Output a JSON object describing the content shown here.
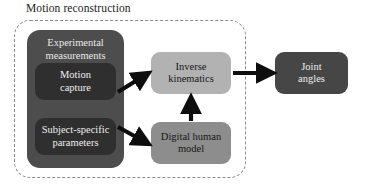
{
  "diagram": {
    "type": "flow-diagram",
    "title": "Motion reconstruction",
    "background_color": "#ffffff",
    "group": {
      "label": "Motion reconstruction",
      "border_style": "dashed",
      "border_color": "#8a8a8a"
    },
    "nodes": [
      {
        "id": "experimental-measurements",
        "label": "Experimental\nmeasurements",
        "fill": "#4d4d4d",
        "text_color": "#e9e9e9",
        "role": "container"
      },
      {
        "id": "motion-capture",
        "label": "Motion\ncapture",
        "fill": "#2f2f2f",
        "text_color": "#eeeeee",
        "role": "input"
      },
      {
        "id": "subject-specific-parameters",
        "label": "Subject-specific\nparameters",
        "fill": "#2f2f2f",
        "text_color": "#eeeeee",
        "role": "input"
      },
      {
        "id": "inverse-kinematics",
        "label": "Inverse\nkinematics",
        "fill": "#b2b2b2",
        "text_color": "#171717",
        "role": "process"
      },
      {
        "id": "digital-human-model",
        "label": "Digital human\nmodel",
        "fill": "#8d8d8d",
        "text_color": "#171717",
        "role": "model"
      },
      {
        "id": "joint-angles",
        "label": "Joint\nangles",
        "fill": "#464646",
        "text_color": "#ededed",
        "role": "output"
      }
    ],
    "edges": [
      {
        "id": "motion-capture-to-inverse-kinematics",
        "from": "motion-capture",
        "to": "inverse-kinematics",
        "direction": "diagonal-up-right"
      },
      {
        "id": "subject-params-to-digital-human-model",
        "from": "subject-specific-parameters",
        "to": "digital-human-model",
        "direction": "diagonal-down-right"
      },
      {
        "id": "digital-human-model-to-inverse-kinematics",
        "from": "digital-human-model",
        "to": "inverse-kinematics",
        "direction": "up"
      },
      {
        "id": "inverse-kinematics-to-joint-angles",
        "from": "inverse-kinematics",
        "to": "joint-angles",
        "direction": "right"
      }
    ]
  }
}
